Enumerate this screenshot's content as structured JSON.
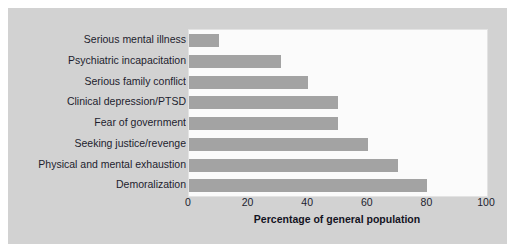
{
  "chart_data": {
    "type": "bar",
    "orientation": "horizontal",
    "title": "",
    "xlabel": "Percentage of general population",
    "ylabel": "",
    "xlim": [
      0,
      100
    ],
    "xticks": [
      "0",
      "20",
      "40",
      "60",
      "80",
      "100"
    ],
    "grid": false,
    "legend": "none",
    "categories": [
      "Serious mental illness",
      "Psychiatric incapacitation",
      "Serious family conflict",
      "Clinical depression/PTSD",
      "Fear of government",
      "Seeking justice/revenge",
      "Physical and mental exhaustion",
      "Demoralization"
    ],
    "values": [
      10,
      31,
      40,
      50,
      50,
      60,
      70,
      80
    ],
    "colors": {
      "bar": "#a3a3a3",
      "plot_background": "#fbfbfb",
      "panel_background": "#d2d2d2",
      "text": "#1d1d2e",
      "figure_background": "#ffffff"
    }
  }
}
